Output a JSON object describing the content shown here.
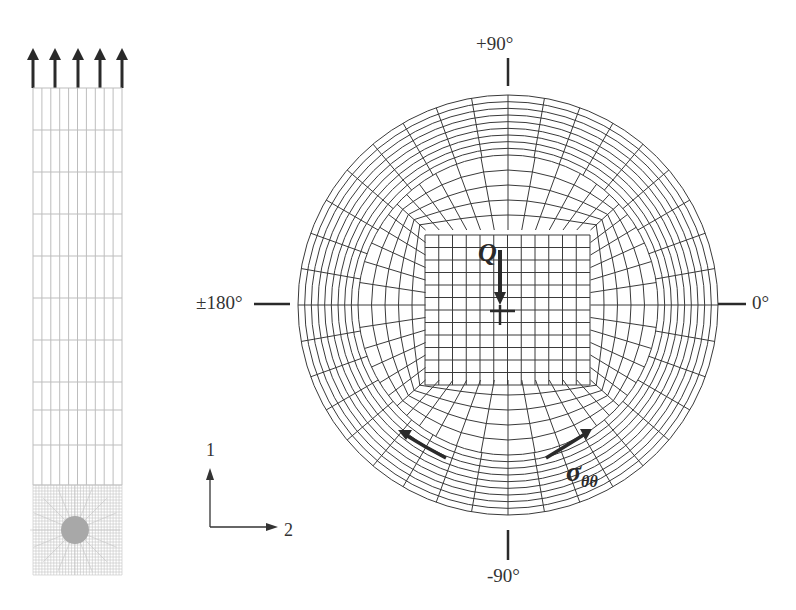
{
  "figure": {
    "left_panel": {
      "description": "Strip mesh with tensile load arrows at top and refined circular inclusion mesh at bottom",
      "load_arrow_count": 5,
      "mesh_columns": 10,
      "mesh_rows": 13
    },
    "axes": {
      "axis_1_label": "1",
      "axis_2_label": "2"
    },
    "right_panel": {
      "angle_labels": {
        "top": "+90°",
        "right": "0°",
        "bottom": "-90°",
        "left": "±180°"
      },
      "load_label": "Q",
      "stress_label": "σ",
      "stress_subscript": "θθ"
    },
    "colors": {
      "mesh_line": "#3a3a3a",
      "light_mesh": "#b8b8b8",
      "arrow": "#2a2a2a",
      "background": "#ffffff"
    }
  }
}
